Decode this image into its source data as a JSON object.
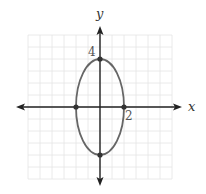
{
  "chart_data": {
    "type": "line",
    "title": "",
    "xlabel": "x",
    "ylabel": "y",
    "xlim": [
      -6,
      6
    ],
    "ylim": [
      -6,
      6
    ],
    "grid": true,
    "grid_step": 1,
    "legend": null,
    "series": [
      {
        "name": "ellipse",
        "equation": "x^2/4 + y^2/16 = 1",
        "center": [
          0,
          0
        ],
        "semi_axis_x": 2,
        "semi_axis_y": 4,
        "color": "#666666"
      }
    ],
    "points": [
      {
        "x": 2,
        "y": 0
      },
      {
        "x": -2,
        "y": 0
      },
      {
        "x": 0,
        "y": 4
      },
      {
        "x": 0,
        "y": -4
      }
    ],
    "annotations": [
      {
        "text": "4",
        "at": [
          0,
          4
        ],
        "position": "upper-left"
      },
      {
        "text": "2",
        "at": [
          2,
          0
        ],
        "position": "lower-right"
      }
    ]
  },
  "labels": {
    "x_axis": "x",
    "y_axis": "y",
    "y_tick": "4",
    "x_tick": "2"
  },
  "colors": {
    "grid": "#e4e4e4",
    "axis": "#222222",
    "curve": "#666666",
    "point": "#333333"
  }
}
